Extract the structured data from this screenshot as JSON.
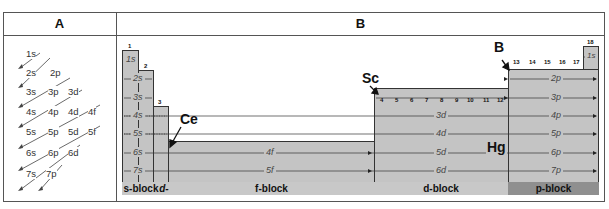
{
  "headers": {
    "col_a": "A",
    "col_b": "B"
  },
  "aufbau": {
    "rows": [
      [
        "1s"
      ],
      [
        "2s",
        "2p"
      ],
      [
        "3s",
        "3p",
        "3d"
      ],
      [
        "4s",
        "4p",
        "4d",
        "4f"
      ],
      [
        "5s",
        "5p",
        "5d",
        "5f"
      ],
      [
        "6s",
        "6p",
        "6d"
      ],
      [
        "7s",
        "7p"
      ]
    ]
  },
  "periodic": {
    "group_numbers": {
      "g1": "1",
      "g2": "2",
      "g3": "3",
      "g4": "4",
      "g5": "5",
      "g6": "6",
      "g7": "7",
      "g8": "8",
      "g9": "9",
      "g10": "10",
      "g11": "11",
      "g12": "12",
      "g13": "13",
      "g14": "14",
      "g15": "15",
      "g16": "16",
      "g17": "17",
      "g18": "18"
    },
    "s_rows": [
      "1s",
      "2s",
      "3s",
      "4s",
      "5s",
      "6s",
      "7s"
    ],
    "f_rows": [
      "4f",
      "5f"
    ],
    "d_rows": [
      "3d",
      "4d",
      "5d",
      "6d"
    ],
    "p_rows": [
      "2p",
      "3p",
      "4p",
      "5p",
      "6p",
      "7p"
    ],
    "he_row": "1s",
    "elements": {
      "ce": "Ce",
      "sc": "Sc",
      "b": "B",
      "hg": "Hg"
    },
    "blocks": {
      "s": "s-block",
      "d_short": "d-",
      "f": "f-block",
      "d": "d-block",
      "p": "p-block"
    },
    "colors": {
      "block_fill": "#c4c4c4",
      "band_light": "#c8c8c8",
      "band_dark": "#8f8f8f",
      "line": "#333333"
    }
  }
}
